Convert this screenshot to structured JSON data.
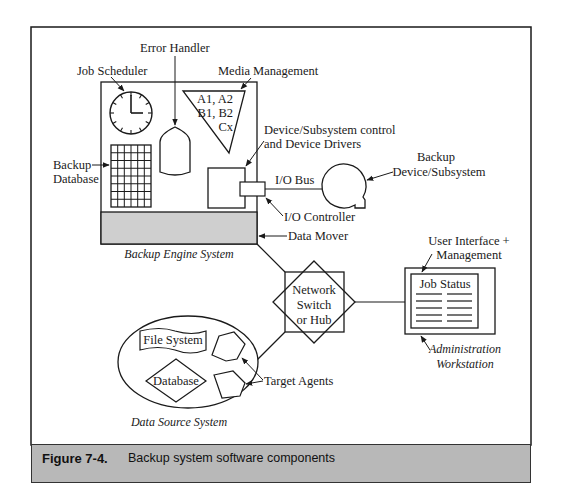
{
  "figure": {
    "number": "Figure 7-4.",
    "caption": "Backup system software components"
  },
  "engine": {
    "title": "Backup Engine System",
    "job_scheduler": "Job Scheduler",
    "error_handler": "Error Handler",
    "media_management": "Media Management",
    "media_labels": [
      "A1, A2",
      "B1, B2",
      "Cx"
    ],
    "backup_database": [
      "Backup",
      "Database"
    ],
    "device_control": [
      "Device/Subsystem control",
      "and Device Drivers"
    ],
    "data_mover": "Data Mover"
  },
  "io": {
    "bus": "I/O Bus",
    "controller": "I/O Controller",
    "device": [
      "Backup",
      "Device/Subsystem"
    ]
  },
  "network": {
    "label": [
      "Network",
      "Switch",
      "or Hub"
    ]
  },
  "workstation": {
    "header": [
      "User Interface +",
      "Management"
    ],
    "screen_title": "Job Status",
    "title": [
      "Administration",
      "Workstation"
    ]
  },
  "data_source": {
    "title": "Data Source System",
    "file_system": "File System",
    "database": "Database",
    "agents": "Target Agents"
  },
  "colors": {
    "stroke": "#1a1a1a",
    "engine_fill": "#cfcfcf",
    "caption_fill": "#b8b8b8"
  }
}
